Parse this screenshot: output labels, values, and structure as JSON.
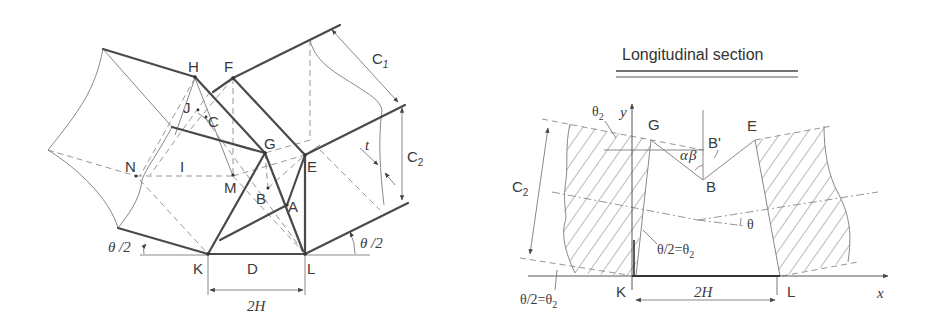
{
  "left_diagram": {
    "points": {
      "H": "H",
      "F": "F",
      "J": "J",
      "C": "C",
      "G": "G",
      "E": "E",
      "N": "N",
      "I": "I",
      "M": "M",
      "B": "B",
      "A": "A",
      "K": "K",
      "D": "D",
      "L": "L"
    },
    "dimensions": {
      "c1_main": "C",
      "c1_sub": "1",
      "c2_main": "C",
      "c2_sub": "2",
      "t": "t",
      "span": "2H",
      "angle_left": "θ /2",
      "angle_right": "θ /2"
    }
  },
  "right_diagram": {
    "title": "Longitudinal section",
    "points": {
      "G": "G",
      "B_prime": "B'",
      "E": "E",
      "B": "B",
      "K": "K",
      "L": "L"
    },
    "axes": {
      "x": "x",
      "y": "y"
    },
    "dimensions": {
      "c2_main": "C",
      "c2_sub": "2",
      "span": "2H"
    },
    "angles": {
      "theta2_main": "θ",
      "theta2_sub": "2",
      "alpha": "α",
      "beta": "β",
      "theta": "θ",
      "inner_main": "θ/2=θ",
      "inner_sub": "2",
      "bottom_main": "θ/2=θ",
      "bottom_sub": "2"
    }
  }
}
